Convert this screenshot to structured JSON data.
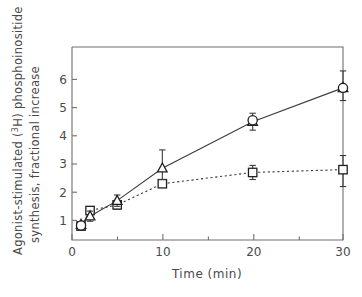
{
  "chart_data": {
    "type": "line",
    "title": "",
    "xlabel": "Time (min)",
    "ylabel": "Agonist-stimulated (3H) phosphoinositide synthesis, fractional increase",
    "ylabel_line1": "Agonist-stimulated (",
    "ylabel_line1_sup": "3",
    "ylabel_line1_cont": "H) phosphoinositide",
    "ylabel_line2": "synthesis, fractional increase",
    "x": [
      1,
      2,
      5,
      10,
      20,
      30
    ],
    "xlim": [
      0,
      32
    ],
    "ylim": [
      0.2,
      6.8
    ],
    "xticks": [
      0,
      10,
      20,
      30
    ],
    "xtick_labels": [
      "0",
      "10",
      "20",
      "30"
    ],
    "xminor_ticks": [
      5,
      15,
      25
    ],
    "yticks": [
      1,
      2,
      3,
      4,
      5,
      6
    ],
    "ytick_labels": [
      "1",
      "2",
      "3",
      "4",
      "5",
      "6"
    ],
    "grid": false,
    "legend": "none",
    "series": [
      {
        "name": "series-1",
        "marker": "triangle",
        "linestyle": "solid",
        "color": "#1f1f1f",
        "values": [
          0.85,
          1.15,
          1.7,
          2.85,
          4.5,
          5.7
        ],
        "errors_upper": [
          0.1,
          0.18,
          0.2,
          0.65,
          0.3,
          0.6
        ],
        "errors_lower": [
          0.1,
          0.18,
          0.2,
          0.4,
          0.3,
          0.45
        ]
      },
      {
        "name": "series-2",
        "marker": "square",
        "linestyle": "dotted",
        "color": "#1f1f1f",
        "values": [
          0.8,
          1.35,
          1.55,
          2.3,
          2.7,
          2.8
        ],
        "errors_upper": [
          0.08,
          0.12,
          0.15,
          0.12,
          0.25,
          0.5
        ],
        "errors_lower": [
          0.08,
          0.12,
          0.15,
          0.12,
          0.25,
          0.6
        ]
      }
    ],
    "extra_markers": [
      {
        "name": "circle-30min",
        "x": 30,
        "y": 5.7,
        "marker": "circle"
      },
      {
        "name": "circle-20min",
        "x": 20,
        "y": 4.55,
        "marker": "circle"
      },
      {
        "name": "circle-1min",
        "x": 1,
        "y": 0.82,
        "marker": "circle"
      }
    ]
  },
  "axes": {
    "x_axis_title": "Time (min)",
    "y_axis_title_part1": "Agonist-stimulated (",
    "y_axis_title_sup": "3",
    "y_axis_title_part2": "H) phosphoinositide",
    "y_axis_title_part3": "synthesis, fractional increase"
  }
}
